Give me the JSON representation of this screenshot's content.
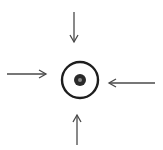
{
  "diagram": {
    "colors": {
      "background": "#ffffff",
      "circle_stroke": "#1e1e1e",
      "dot_fill": "#2a2a2a",
      "dot_center": "#8a8a8a",
      "arrow_stroke": "#4a4a4a"
    },
    "target": {
      "cx": 80,
      "cy": 80,
      "r": 18,
      "dot_r": 6,
      "dot_center_r": 2
    },
    "arrows": [
      {
        "name": "arrow-from-top",
        "x1": 74,
        "y1": 12,
        "x2": 74,
        "y2": 42
      },
      {
        "name": "arrow-from-left",
        "x1": 7,
        "y1": 74,
        "x2": 46,
        "y2": 74
      },
      {
        "name": "arrow-from-right",
        "x1": 155,
        "y1": 83,
        "x2": 109,
        "y2": 83
      },
      {
        "name": "arrow-from-bottom",
        "x1": 77,
        "y1": 145,
        "x2": 77,
        "y2": 115
      }
    ]
  }
}
